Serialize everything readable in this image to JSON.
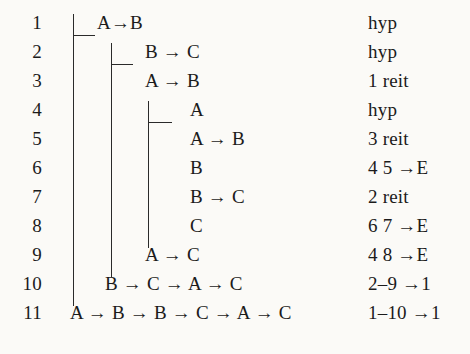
{
  "figure": {
    "kind": "fitch-natural-deduction-proof",
    "background_color": "#fbfaf7",
    "ink_color": "#1b1b1b",
    "rule_color": "#2a2a2a"
  },
  "columns": {
    "line_number_header": "",
    "formula_header": "",
    "justification_header": ""
  },
  "rows": [
    {
      "n": "1",
      "formula": "A→B",
      "justification": "hyp",
      "depth": 1
    },
    {
      "n": "2",
      "formula": "B → C",
      "justification": "hyp",
      "depth": 2
    },
    {
      "n": "3",
      "formula": "A → B",
      "justification": "1 reit",
      "depth": 2
    },
    {
      "n": "4",
      "formula": "A",
      "justification": "hyp",
      "depth": 3
    },
    {
      "n": "5",
      "formula": "A → B",
      "justification": "3 reit",
      "depth": 3
    },
    {
      "n": "6",
      "formula": "B",
      "justification": "4 5 →E",
      "depth": 3
    },
    {
      "n": "7",
      "formula": "B → C",
      "justification": "2 reit",
      "depth": 3
    },
    {
      "n": "8",
      "formula": "C",
      "justification": "6 7 →E",
      "depth": 3
    },
    {
      "n": "9",
      "formula": "A → C",
      "justification": "4 8 →E",
      "depth": 2
    },
    {
      "n": "10",
      "formula": "B → C → A → C",
      "justification": "2–9 →1",
      "depth": 1
    },
    {
      "n": "11",
      "formula": "A → B → B → C → A → C",
      "justification": "1–10 →1",
      "depth": 0
    }
  ]
}
